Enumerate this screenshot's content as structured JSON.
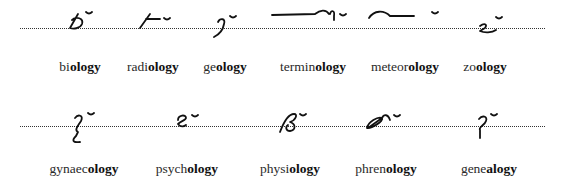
{
  "rows": [
    {
      "baseline_y": 28,
      "items": [
        {
          "prefix": "bi",
          "suffix": "ology",
          "x": 80,
          "outline": "biology-outline"
        },
        {
          "prefix": "radi",
          "suffix": "ology",
          "x": 153,
          "outline": "radiology-outline"
        },
        {
          "prefix": "ge",
          "suffix": "ology",
          "x": 225,
          "outline": "geology-outline"
        },
        {
          "prefix": "termin",
          "suffix": "ology",
          "x": 313,
          "outline": "terminology-outline"
        },
        {
          "prefix": "meteor",
          "suffix": "ology",
          "x": 405,
          "outline": "meteorology-outline"
        },
        {
          "prefix": "zo",
          "suffix": "ology",
          "x": 485,
          "outline": "zoology-outline"
        }
      ]
    },
    {
      "baseline_y": 126,
      "items": [
        {
          "prefix": "gynaec",
          "suffix": "ology",
          "x": 84,
          "outline": "gynaecology-outline"
        },
        {
          "prefix": "psych",
          "suffix": "ology",
          "x": 187,
          "outline": "psychology-outline"
        },
        {
          "prefix": "physi",
          "suffix": "ology",
          "x": 290,
          "outline": "physiology-outline"
        },
        {
          "prefix": "phren",
          "suffix": "ology",
          "x": 386,
          "outline": "phrenology-outline"
        },
        {
          "prefix": "gene",
          "suffix": "alogy",
          "x": 489,
          "outline": "genealogy-outline"
        }
      ]
    }
  ]
}
